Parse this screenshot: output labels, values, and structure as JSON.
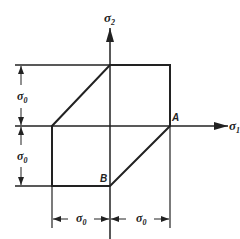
{
  "diagram": {
    "type": "yield-surface",
    "axes": {
      "horizontal": {
        "label": "σ",
        "subscript": "1"
      },
      "vertical": {
        "label": "σ",
        "subscript": "2"
      }
    },
    "points": {
      "A": {
        "label": "A"
      },
      "B": {
        "label": "B"
      }
    },
    "dimensions": {
      "left_upper": {
        "label": "σ",
        "subscript": "0"
      },
      "left_lower": {
        "label": "σ",
        "subscript": "0"
      },
      "bottom_left": {
        "label": "σ",
        "subscript": "0"
      },
      "bottom_right": {
        "label": "σ",
        "subscript": "0"
      }
    },
    "colors": {
      "line": "#222222",
      "background": "#ffffff"
    }
  }
}
